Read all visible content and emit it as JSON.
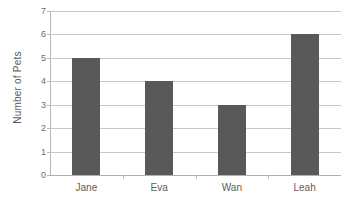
{
  "chart_data": {
    "type": "bar",
    "title": "",
    "subtitle": "",
    "xlabel": "",
    "ylabel": "Number of Pets",
    "categories": [
      "Jane",
      "Eva",
      "Wan",
      "Leah"
    ],
    "values": [
      5,
      4,
      3,
      6
    ],
    "series": [
      {
        "name": "Number of Pets",
        "values": [
          5,
          4,
          3,
          6
        ]
      }
    ],
    "ylim": [
      0,
      7
    ],
    "ytick_labels": [
      "0",
      "1",
      "2",
      "3",
      "4",
      "5",
      "6",
      "7"
    ],
    "ytick_values": [
      0,
      1,
      2,
      3,
      4,
      5,
      6,
      7
    ],
    "ytick_step": 1,
    "grid": "horizontal",
    "legend": "none",
    "annotations": [],
    "colors": {
      "bar": "#595959",
      "gridline": "#c8c8c8",
      "axis_line": "#b8b8b8",
      "tick_text": "#6b6b6b",
      "category_text": "#5d5d5d",
      "axis_title_text": "#5a5a5a",
      "background": "#ffffff"
    }
  }
}
